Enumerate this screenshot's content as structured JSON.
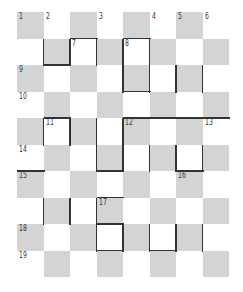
{
  "puzzle": {
    "type": "crossword-checkerboard",
    "rows": 10,
    "cols": 8,
    "colors": {
      "shaded": "#d4d4d4",
      "plain": "#ffffff",
      "line": "#333333"
    },
    "shading_rule": "cell is shaded when (row + col) is even",
    "clue_numbers": [
      {
        "n": "1",
        "r": 0,
        "c": 0
      },
      {
        "n": "2",
        "r": 0,
        "c": 1
      },
      {
        "n": "3",
        "r": 0,
        "c": 3
      },
      {
        "n": "4",
        "r": 0,
        "c": 5
      },
      {
        "n": "5",
        "r": 0,
        "c": 6
      },
      {
        "n": "6",
        "r": 0,
        "c": 7
      },
      {
        "n": "7",
        "r": 1,
        "c": 2
      },
      {
        "n": "8",
        "r": 1,
        "c": 4
      },
      {
        "n": "9",
        "r": 2,
        "c": 0
      },
      {
        "n": "10",
        "r": 3,
        "c": 0
      },
      {
        "n": "11",
        "r": 4,
        "c": 1
      },
      {
        "n": "12",
        "r": 4,
        "c": 4
      },
      {
        "n": "13",
        "r": 4,
        "c": 7
      },
      {
        "n": "14",
        "r": 5,
        "c": 0
      },
      {
        "n": "15",
        "r": 6,
        "c": 0
      },
      {
        "n": "16",
        "r": 6,
        "c": 6
      },
      {
        "n": "17",
        "r": 7,
        "c": 3
      },
      {
        "n": "18",
        "r": 8,
        "c": 0
      },
      {
        "n": "19",
        "r": 9,
        "c": 0
      }
    ],
    "bars": [
      {
        "o": "v",
        "r": 1,
        "c": 1,
        "len": 1
      },
      {
        "o": "h",
        "r": 2,
        "c": 1,
        "len": 1
      },
      {
        "o": "h",
        "r": 1,
        "c": 2,
        "len": 1
      },
      {
        "o": "v",
        "r": 1,
        "c": 2,
        "len": 1
      },
      {
        "o": "v",
        "r": 1,
        "c": 3,
        "len": 1
      },
      {
        "o": "h",
        "r": 1,
        "c": 4,
        "len": 1
      },
      {
        "o": "v",
        "r": 1,
        "c": 4,
        "len": 2
      },
      {
        "o": "v",
        "r": 1,
        "c": 5,
        "len": 2
      },
      {
        "o": "h",
        "r": 3,
        "c": 4,
        "len": 1
      },
      {
        "o": "v",
        "r": 2,
        "c": 6,
        "len": 1
      },
      {
        "o": "v",
        "r": 2,
        "c": 7,
        "len": 1
      },
      {
        "o": "h",
        "r": 4,
        "c": 1,
        "len": 1
      },
      {
        "o": "v",
        "r": 4,
        "c": 1,
        "len": 1
      },
      {
        "o": "v",
        "r": 4,
        "c": 2,
        "len": 1
      },
      {
        "o": "v",
        "r": 4,
        "c": 3,
        "len": 2
      },
      {
        "o": "v",
        "r": 4,
        "c": 4,
        "len": 2
      },
      {
        "o": "h",
        "r": 6,
        "c": 3,
        "len": 1
      },
      {
        "o": "h",
        "r": 4,
        "c": 4,
        "len": 4
      },
      {
        "o": "v",
        "r": 5,
        "c": 5,
        "len": 1
      },
      {
        "o": "v",
        "r": 5,
        "c": 6,
        "len": 1
      },
      {
        "o": "v",
        "r": 5,
        "c": 7,
        "len": 1
      },
      {
        "o": "h",
        "r": 6,
        "c": 6,
        "len": 1
      },
      {
        "o": "h",
        "r": 6,
        "c": 0,
        "len": 1
      },
      {
        "o": "v",
        "r": 7,
        "c": 1,
        "len": 1
      },
      {
        "o": "v",
        "r": 7,
        "c": 2,
        "len": 1
      },
      {
        "o": "h",
        "r": 7,
        "c": 3,
        "len": 1
      },
      {
        "o": "v",
        "r": 7,
        "c": 3,
        "len": 2
      },
      {
        "o": "h",
        "r": 8,
        "c": 3,
        "len": 1
      },
      {
        "o": "v",
        "r": 8,
        "c": 4,
        "len": 1
      },
      {
        "o": "h",
        "r": 9,
        "c": 3,
        "len": 1
      },
      {
        "o": "v",
        "r": 8,
        "c": 5,
        "len": 1
      },
      {
        "o": "v",
        "r": 8,
        "c": 6,
        "len": 1
      },
      {
        "o": "h",
        "r": 9,
        "c": 5,
        "len": 1
      },
      {
        "o": "v",
        "r": 8,
        "c": 7,
        "len": 1
      }
    ]
  }
}
